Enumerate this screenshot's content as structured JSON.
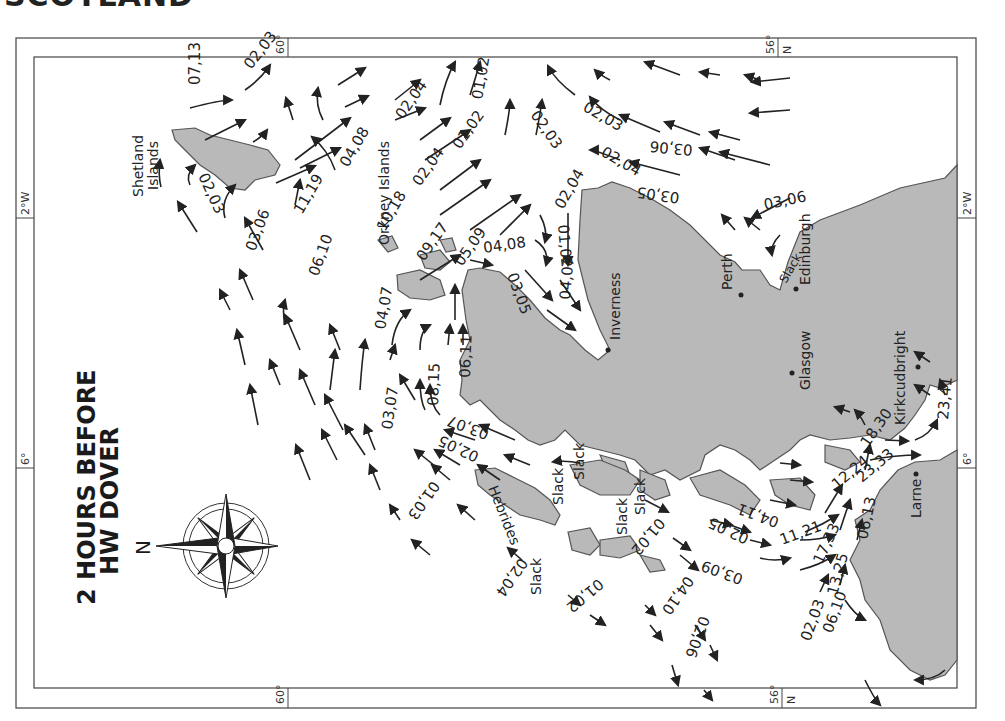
{
  "page": {
    "heading": "SCOTLAND",
    "map_title_line1": "2 HOURS BEFORE",
    "map_title_line2": "HW DOVER",
    "compass_label": "N"
  },
  "grid_labels": {
    "top_lat_60": "60°",
    "top_lat_56": "56°",
    "top_n": "N",
    "bottom_lat_60": "60°",
    "bottom_lat_56": "56°",
    "bottom_n": "N",
    "left_lon_2w": "2°W",
    "left_lon_6": "6°",
    "right_lon_2w": "2°W",
    "right_lon_6": "6°"
  },
  "places": {
    "shetland": "Shetland",
    "shetland2": "Islands",
    "orkney": "Orkney Islands",
    "inverness": "Inverness",
    "perth": "Perth",
    "edinburgh": "Edinburgh",
    "glasgow": "Glasgow",
    "kirkcudbright": "Kirkcudbright",
    "larne": "Larne",
    "hebrides": "Hebrides"
  },
  "tidal_rates": {
    "r1": "07,13",
    "r2": "02,03",
    "r3": "02,03",
    "r4": "03,06",
    "r5": "11,19",
    "r6": "04,08",
    "r7": "06,10",
    "r8": "10,18",
    "r9": "02,04",
    "r10": "02,04",
    "r11": "09,17",
    "r12": "01,02",
    "r13": "01,02",
    "r14": "05,09",
    "r15": "04,08",
    "r16": "02,03",
    "r17": "02,03",
    "r18": "02,04",
    "r19": "02,04",
    "r20": "03,06",
    "r21": "03,05",
    "r22": "03,06",
    "r23": "01,02",
    "r24": "04,07",
    "r25": "03,05",
    "r26": "04,07",
    "r27": "06,11",
    "r28": "08,15",
    "r29": "03,07",
    "r30": "03,07",
    "r31": "02,05",
    "r32": "01,03",
    "r33": "02,04",
    "r34": "01,02",
    "r35": "04,10",
    "r36": "02,06",
    "r37": "01,02",
    "r38": "02,05",
    "r39": "04,11",
    "r40": "11,21",
    "r41": "03,09",
    "r42": "17,33",
    "r43": "13,25",
    "r44": "06,10",
    "r45": "02,03",
    "r46": "06,13",
    "r47": "12,24",
    "r48": "23,33",
    "r49": "18,30",
    "r50": "23,41"
  },
  "slack_labels": {
    "s1": "Slack",
    "s2": "Slack",
    "s3": "Slack",
    "s4": "Slack",
    "s5": "Slack",
    "s6": "Slack"
  },
  "colors": {
    "land": "#b9b9b9",
    "land_outline": "#555555",
    "sea": "#ffffff",
    "ink": "#222222"
  }
}
